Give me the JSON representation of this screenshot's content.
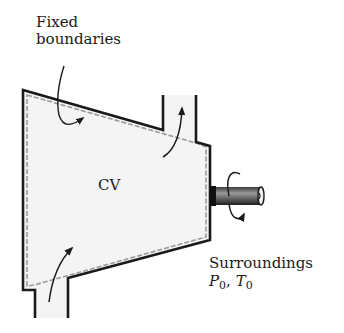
{
  "diagram": {
    "labels": {
      "fixed_line1": "Fixed",
      "fixed_line2": "boundaries",
      "cv": "CV",
      "surroundings": "Surroundings",
      "p_symbol": "P",
      "p_sub": "0",
      "sep": ", ",
      "t_symbol": "T",
      "t_sub": "0"
    },
    "elements": [
      {
        "id": "control-volume",
        "shape": "tapered chamber",
        "fill": "#f4f4f4"
      },
      {
        "id": "inlet-pipe",
        "position": "bottom-left",
        "flow": "up into CV"
      },
      {
        "id": "exit-pipe",
        "position": "top-right",
        "flow": "up out of CV"
      },
      {
        "id": "shaft",
        "position": "right",
        "motion": "rotating"
      },
      {
        "id": "boundary-pointer",
        "points_to": "top boundary"
      }
    ],
    "colors": {
      "wall": "#1a1a1a",
      "cv_fill": "#f4f4f4",
      "dashed_boundary": "#9a9a9a",
      "shaft_dark": "#2a2a2a",
      "shaft_light": "#8a8a8a"
    }
  }
}
